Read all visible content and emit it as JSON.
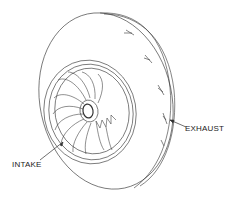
{
  "diagram": {
    "labels": {
      "exhaust": "EXHAUST",
      "intake": "INTAKE"
    },
    "colors": {
      "line": "#333333",
      "background": "#ffffff"
    }
  }
}
